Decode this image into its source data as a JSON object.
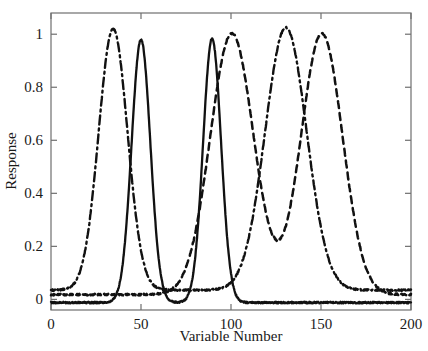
{
  "chart_data": {
    "type": "line",
    "title": "",
    "xlabel": "Variable Number",
    "ylabel": "Response",
    "xlim": [
      0,
      200
    ],
    "ylim": [
      -0.04,
      1.08
    ],
    "xticks": [
      0,
      50,
      100,
      150,
      200
    ],
    "xticklabels": [
      "0",
      "50",
      "100",
      "150",
      "200"
    ],
    "yticks": [
      0,
      0.2,
      0.4,
      0.6,
      0.8,
      1
    ],
    "yticklabels": [
      "0",
      "0.2",
      "0.4",
      "0.6",
      "0.8",
      "1"
    ],
    "grid": false,
    "legend": "none",
    "line_color": "#111111",
    "axis_color": "#6f6f6f",
    "background": "#ffffff",
    "series": [
      {
        "name": "solid",
        "style": "solid",
        "baseline": -0.012,
        "peaks": [
          {
            "center": 50,
            "amplitude": 0.992,
            "width": 5.2
          },
          {
            "center": 89.5,
            "amplitude": 0.995,
            "width": 5.0
          }
        ]
      },
      {
        "name": "dashed",
        "style": "dashed",
        "baseline": 0.018,
        "peaks": [
          {
            "center": 100.5,
            "amplitude": 0.985,
            "width": 12.0
          },
          {
            "center": 150.5,
            "amplitude": 0.985,
            "width": 11.5
          }
        ]
      },
      {
        "name": "dash-dot",
        "style": "dashdot",
        "baseline": 0.035,
        "peaks": [
          {
            "center": 34.5,
            "amplitude": 0.985,
            "width": 8.0
          },
          {
            "center": 130.5,
            "amplitude": 0.99,
            "width": 11.5
          }
        ]
      }
    ]
  },
  "plot_box": {
    "left": 51,
    "right": 411,
    "top": 13,
    "bottom": 310
  }
}
